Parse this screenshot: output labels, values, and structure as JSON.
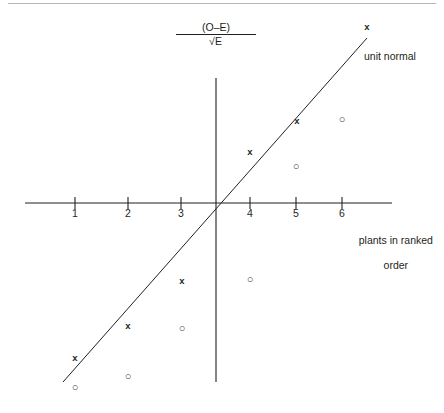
{
  "chart_data": {
    "type": "scatter",
    "title": "",
    "xlabel": "plants in ranked order",
    "ylabel": "(O-E)/√E",
    "ylabel_numerator": "(O–E)",
    "ylabel_denominator_symbol": "√",
    "ylabel_denominator_radicand": "E",
    "xlim": [
      0.2,
      7.2
    ],
    "ylim": [
      -3.6,
      3.6
    ],
    "grid": false,
    "legend_position": "inline-annotation",
    "annotations": [
      {
        "text": "unit normal",
        "x": 6.5,
        "y": 2.6
      }
    ],
    "xticks": [
      1,
      2,
      3,
      4,
      5,
      6
    ],
    "xtick_labels": [
      "1",
      "2",
      "3",
      "4",
      "5",
      "6"
    ],
    "reference_line": {
      "name": "unit normal",
      "label": "unit normal",
      "x_start": 0.75,
      "y_start": -2.6,
      "x_end": 6.45,
      "y_end": 2.9
    },
    "series": [
      {
        "name": "x-series",
        "marker": "x",
        "points": [
          {
            "x": 1.0,
            "y": -2.25
          },
          {
            "x": 2.0,
            "y": -1.6
          },
          {
            "x": 3.0,
            "y": -0.75
          },
          {
            "x": 4.0,
            "y": 0.75
          },
          {
            "x": 5.0,
            "y": 1.45
          },
          {
            "x": 6.45,
            "y": 3.05
          }
        ]
      },
      {
        "name": "o-series",
        "marker": "o",
        "points": [
          {
            "x": 1.0,
            "y": -2.85
          },
          {
            "x": 2.0,
            "y": -2.65
          },
          {
            "x": 3.0,
            "y": -1.6
          },
          {
            "x": 4.0,
            "y": -1.05
          },
          {
            "x": 5.0,
            "y": 0.45
          },
          {
            "x": 6.0,
            "y": 1.5
          }
        ]
      }
    ],
    "markers": {
      "x_glyph": "x",
      "o_glyph": "○"
    },
    "colors": {
      "ink": "#231f20",
      "rule": "#b9b6b4",
      "background": "#ffffff"
    }
  },
  "geometry": {
    "x_axis": {
      "x1": 25,
      "x2": 392,
      "y": 203
    },
    "y_axis": {
      "x": 216,
      "y1": 78,
      "y2": 382
    },
    "tick_px": [
      {
        "label": "1",
        "x": 75
      },
      {
        "label": "2",
        "x": 128
      },
      {
        "label": "3",
        "x": 181
      },
      {
        "label": "4",
        "x": 250
      },
      {
        "label": "5",
        "x": 296
      },
      {
        "label": "6",
        "x": 342
      }
    ],
    "tick_label_y": 207,
    "line_px": {
      "x1": 63,
      "y1": 382,
      "x2": 367,
      "y2": 38
    },
    "x_markers_px": [
      {
        "x": 75,
        "y": 359
      },
      {
        "x": 128,
        "y": 327
      },
      {
        "x": 182,
        "y": 282
      },
      {
        "x": 250,
        "y": 153
      },
      {
        "x": 297,
        "y": 122
      },
      {
        "x": 367,
        "y": 28
      }
    ],
    "o_markers_px": [
      {
        "x": 75,
        "y": 388
      },
      {
        "x": 128,
        "y": 377
      },
      {
        "x": 182,
        "y": 329
      },
      {
        "x": 250,
        "y": 280
      },
      {
        "x": 296,
        "y": 167
      },
      {
        "x": 342,
        "y": 120
      }
    ],
    "ylabel_px": {
      "x": 216,
      "y": 36
    }
  },
  "labels": {
    "unit_normal": "unit normal",
    "axis_caption_line1": "plants in ranked",
    "axis_caption_line2": "order",
    "numerator": "(O–E)",
    "radical_sign": "√",
    "radicand": "E"
  }
}
